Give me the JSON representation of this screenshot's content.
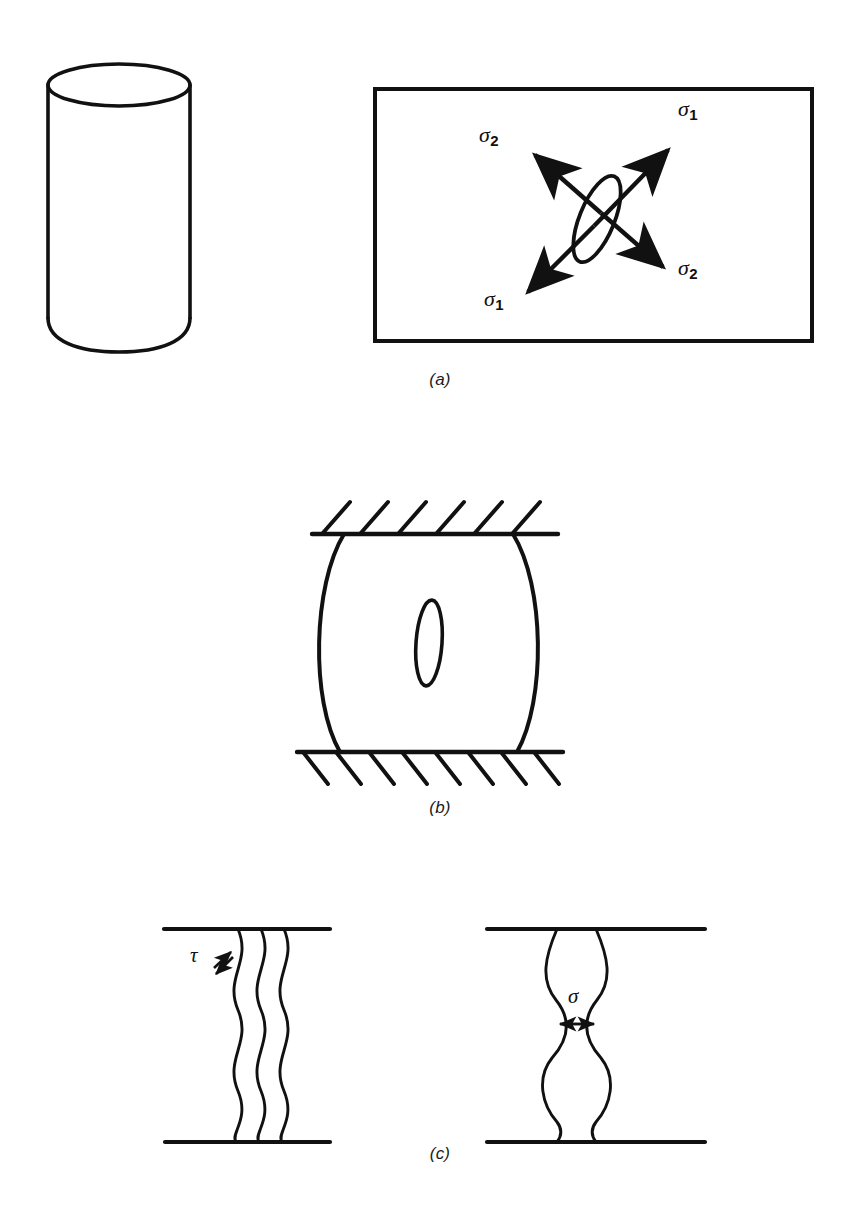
{
  "figure": {
    "background_color": "#ffffff",
    "ink_color": "#111111",
    "width": 864,
    "height": 1211
  },
  "panels": [
    {
      "id": "a",
      "label": "(a)",
      "label_x": 400,
      "label_y": 378,
      "description": "Cylindrical specimen and enlarged element containing an inclined elliptical flaw loaded by two principal stresses",
      "items": {
        "cylinder": {
          "name": "cylinder-specimen"
        },
        "element_box": {
          "name": "stress-element-rectangle"
        },
        "flaw": {
          "name": "inclined-elliptical-flaw"
        }
      },
      "stress_labels": [
        {
          "key": "sigma1_top",
          "base": "σ",
          "subscript": "1",
          "x": 686,
          "y": 107,
          "arrow": "up-right"
        },
        {
          "key": "sigma2_top",
          "base": "σ",
          "subscript": "2",
          "x": 487,
          "y": 133,
          "arrow": "up-left"
        },
        {
          "key": "sigma2_bottom",
          "base": "σ",
          "subscript": "2",
          "x": 686,
          "y": 266,
          "arrow": "down-right"
        },
        {
          "key": "sigma1_bottom",
          "base": "σ",
          "subscript": "1",
          "x": 492,
          "y": 297,
          "arrow": "down-left"
        }
      ]
    },
    {
      "id": "b",
      "label": "(b)",
      "label_x": 400,
      "label_y": 806,
      "description": "Barrelled specimen compressed between two hatched rigid platens with a vertical axial crack at its centre",
      "items": {
        "top_platen": {
          "name": "top-platen",
          "hatch_count": 6,
          "hatch_direction": "up-right"
        },
        "bottom_platen": {
          "name": "bottom-platen",
          "hatch_count": 8,
          "hatch_direction": "down-right"
        },
        "specimen": {
          "name": "barrelled-specimen"
        },
        "crack": {
          "name": "axial-crack-ellipse"
        }
      }
    },
    {
      "id": "c",
      "label": "(c)",
      "label_x": 400,
      "label_y": 1152,
      "description": "Grain boundary separation mechanisms: shear sliding and tensile opening",
      "sub_figures": [
        {
          "key": "shear",
          "name": "shear-mechanism-sketch",
          "wavy_line_count": 3,
          "label": {
            "base": "τ",
            "x": 196,
            "y": 955
          },
          "arrow": {
            "name": "shear-double-arrow",
            "orientation": "diagonal-up-right"
          }
        },
        {
          "key": "tensile",
          "name": "tensile-mechanism-sketch",
          "wavy_line_count": 2,
          "label": {
            "base": "σ",
            "x": 573,
            "y": 996
          },
          "arrow": {
            "name": "tensile-double-arrow",
            "orientation": "horizontal"
          }
        }
      ]
    }
  ],
  "caption": {
    "visible": false,
    "text": ""
  },
  "glyphs": {
    "sigma": "σ",
    "tau": "τ"
  }
}
